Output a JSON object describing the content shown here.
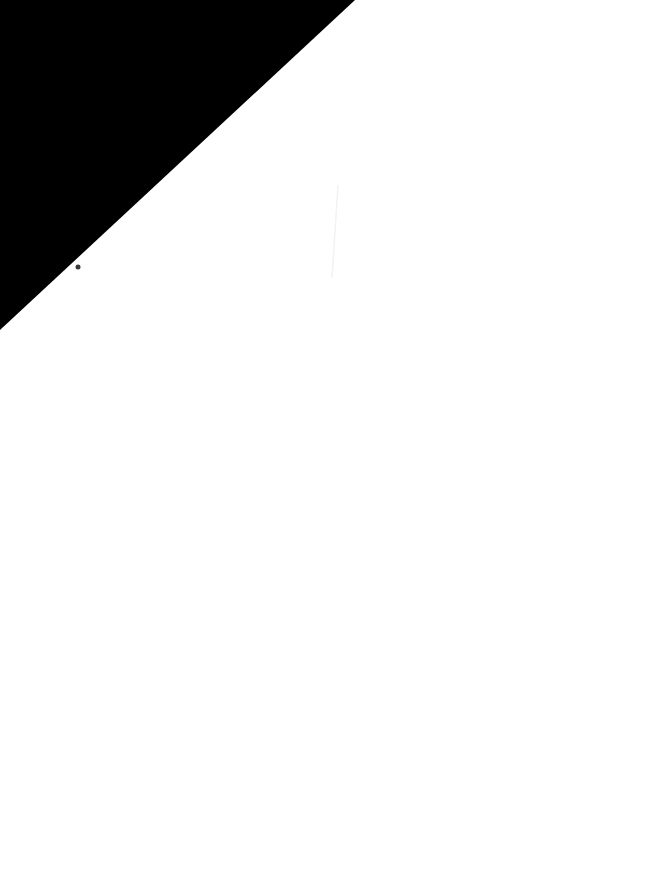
{
  "canvas": {
    "width": 665,
    "height": 888,
    "background": "#ffffff"
  },
  "shapes": {
    "triangle": {
      "fill": "#000000",
      "points": "0,0 355,0 0,330"
    },
    "dot": {
      "fill": "#3a3a3a",
      "cx": 78,
      "cy": 267,
      "r": 2.5
    },
    "streak": {
      "stroke": "#f2f2f2",
      "x1": 338,
      "y1": 185,
      "x2": 332,
      "y2": 278
    }
  }
}
